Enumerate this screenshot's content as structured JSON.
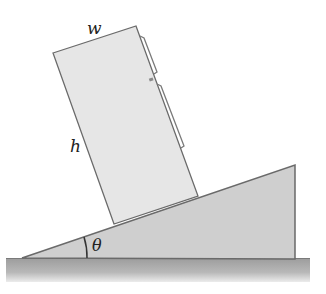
{
  "diagram": {
    "type": "physics-incline",
    "labels": {
      "width": "w",
      "height": "h",
      "angle": "θ"
    },
    "colors": {
      "background": "#ffffff",
      "box_fill": "#e4e4e4",
      "ramp_fill": "#cfcfcf",
      "ground_fill": "#a9a9a9",
      "stroke": "#6a6a6a"
    },
    "objects": [
      {
        "name": "refrigerator-box",
        "shape": "rotated-rectangle",
        "corners": [
          [
            53,
            53
          ],
          [
            136,
            26
          ],
          [
            198,
            196
          ],
          [
            114,
            224
          ]
        ]
      },
      {
        "name": "inclined-ramp",
        "shape": "right-triangle",
        "vertices": [
          [
            22,
            258
          ],
          [
            295,
            165
          ],
          [
            295,
            259
          ]
        ]
      },
      {
        "name": "ground",
        "shape": "strip",
        "x": [
          6,
          310
        ],
        "y": [
          258,
          282
        ]
      }
    ]
  }
}
